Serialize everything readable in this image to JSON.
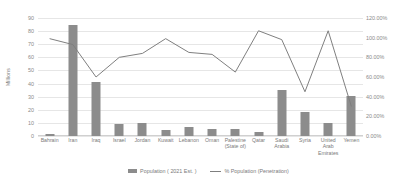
{
  "chart_data": {
    "type": "bar",
    "title": "",
    "xlabel": "",
    "ylabel": "Millions",
    "y2label": "",
    "grid": true,
    "legend_position": "bottom",
    "ylim": [
      0,
      90
    ],
    "y2lim": [
      0,
      1.2
    ],
    "yticks": [
      "0",
      "10",
      "20",
      "30",
      "40",
      "50",
      "60",
      "70",
      "80",
      "90"
    ],
    "y2ticks": [
      "0.00%",
      "20.00%",
      "40.00%",
      "60.00%",
      "80.00%",
      "100.00%",
      "120.00%"
    ],
    "categories": [
      "Bahrain",
      "Iran",
      "Iraq",
      "Israel",
      "Jordan",
      "Kuwait",
      "Lebanon",
      "Oman",
      "Palestine\n(State of)",
      "Qatar",
      "Saudi\nArabia",
      "Syria",
      "United\nArab\nEmirates",
      "Yemen"
    ],
    "series": [
      {
        "name": "Population ( 2021 Est. )",
        "type": "bar",
        "axis": "left",
        "color": "#8c8c8c",
        "values": [
          1.8,
          85.0,
          41.2,
          8.8,
          10.3,
          4.3,
          6.8,
          5.2,
          5.2,
          2.9,
          35.3,
          18.3,
          10.0,
          30.5
        ]
      },
      {
        "name": "% Population (Penetration)",
        "type": "line",
        "axis": "right",
        "color": "#7f7f7f",
        "values": [
          0.99,
          0.93,
          0.6,
          0.8,
          0.84,
          0.99,
          0.85,
          0.83,
          0.65,
          1.07,
          0.98,
          0.45,
          1.07,
          0.3
        ]
      }
    ]
  },
  "legend": {
    "items": [
      {
        "label": "Population ( 2021 Est. )",
        "marker": "bar-swatch"
      },
      {
        "label": "% Population (Penetration)",
        "marker": "line-swatch"
      }
    ]
  }
}
